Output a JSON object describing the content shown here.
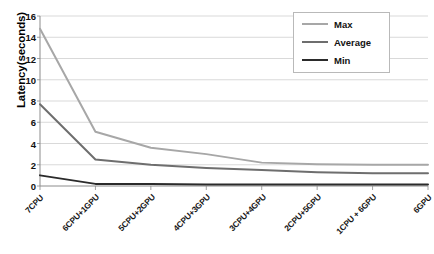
{
  "chart_data": {
    "type": "line",
    "title": "",
    "xlabel": "",
    "ylabel": "Latency(seconds)",
    "ylim": [
      0,
      16
    ],
    "ytick_step": 2,
    "yticks": [
      "0",
      "2",
      "4",
      "6",
      "8",
      "10",
      "12",
      "14",
      "16"
    ],
    "grid": true,
    "legend_position": "top-right",
    "categories": [
      "7CPU",
      "6CPU+1GPU",
      "5CPU+2GPU",
      "4CPU+3GPU",
      "3CPU+4GPU",
      "2CPU+5GPU",
      "1CPU + 6GPU",
      "6GPU"
    ],
    "series": [
      {
        "name": "Max",
        "color": "#a7a7a7",
        "values": [
          14.8,
          5.1,
          3.6,
          3.0,
          2.2,
          2.05,
          2.0,
          2.0
        ]
      },
      {
        "name": "Average",
        "color": "#6e6e6e",
        "values": [
          7.7,
          2.5,
          2.0,
          1.7,
          1.5,
          1.3,
          1.2,
          1.2
        ]
      },
      {
        "name": "Min",
        "color": "#2b2b2b",
        "values": [
          1.0,
          0.2,
          0.2,
          0.15,
          0.15,
          0.15,
          0.15,
          0.15
        ]
      }
    ]
  },
  "legend": {
    "entries": [
      {
        "label": "Max"
      },
      {
        "label": "Average"
      },
      {
        "label": "Min"
      }
    ]
  },
  "axes": {
    "y_title": "Latency(seconds)"
  },
  "colors": {
    "axis": "#8c8c8c",
    "grid": "#c8c8c8",
    "background": "#ffffff"
  }
}
